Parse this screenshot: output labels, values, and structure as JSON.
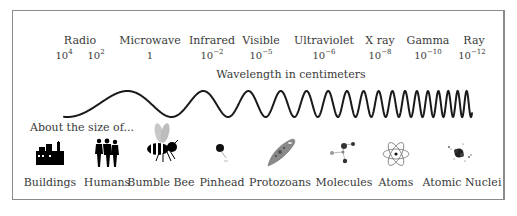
{
  "bands": [
    {
      "name": "Radio",
      "x": 80
    },
    {
      "name": "Microwave",
      "x": 150
    },
    {
      "name": "Infrared",
      "x": 212
    },
    {
      "name": "Visible",
      "x": 261
    },
    {
      "name": "Ultraviolet",
      "x": 324
    },
    {
      "name": "X ray",
      "x": 380
    },
    {
      "name": "Gamma",
      "x": 428
    },
    {
      "name": "Ray",
      "x": 474
    }
  ],
  "wavelengths": [
    {
      "base": "10",
      "exp": "4",
      "x": 64
    },
    {
      "base": "10",
      "exp": "2",
      "x": 96
    },
    {
      "base": "1",
      "exp": "",
      "x": 150
    },
    {
      "base": "10",
      "exp": "−2",
      "x": 212
    },
    {
      "base": "10",
      "exp": "−5",
      "x": 261
    },
    {
      "base": "10",
      "exp": "−6",
      "x": 324
    },
    {
      "base": "10",
      "exp": "−8",
      "x": 380
    },
    {
      "base": "10",
      "exp": "−10",
      "x": 428
    },
    {
      "base": "10",
      "exp": "−12",
      "x": 472
    }
  ],
  "axis_title": "Wavelength in centimeters",
  "about_label": "About the size of...",
  "objects": [
    {
      "label": "Buildings",
      "icon": "buildings-icon",
      "x": 50
    },
    {
      "label": "Humans",
      "icon": "humans-icon",
      "x": 107
    },
    {
      "label": "Bumble Bee",
      "icon": "bumble-bee-icon",
      "x": 161
    },
    {
      "label": "Pinhead",
      "icon": "pinhead-icon",
      "x": 222
    },
    {
      "label": "Protozoans",
      "icon": "protozoan-icon",
      "x": 280
    },
    {
      "label": "Molecules",
      "icon": "molecule-icon",
      "x": 344
    },
    {
      "label": "Atoms",
      "icon": "atom-icon",
      "x": 396
    },
    {
      "label": "Atomic Nuclei",
      "icon": "atomic-nucleus-icon",
      "x": 462
    }
  ],
  "wave": {
    "x_start": 64,
    "x_end": 472,
    "y_center": 104,
    "amplitude": 13,
    "stroke": "#1a1a1a"
  }
}
